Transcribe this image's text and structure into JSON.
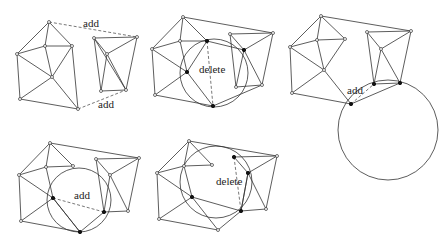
{
  "colors": {
    "stroke": "#333333",
    "background": "#ffffff",
    "text": "#222222"
  },
  "panels": [
    {
      "id": "panel-1",
      "left_mesh": {
        "vertices": [
          [
            49,
            22
          ],
          [
            17,
            54
          ],
          [
            45,
            46
          ],
          [
            72,
            46
          ],
          [
            52,
            77
          ],
          [
            20,
            99
          ],
          [
            78,
            109
          ]
        ],
        "edges": [
          [
            0,
            1
          ],
          [
            0,
            2
          ],
          [
            0,
            3
          ],
          [
            1,
            2
          ],
          [
            2,
            3
          ],
          [
            1,
            4
          ],
          [
            2,
            4
          ],
          [
            3,
            4
          ],
          [
            3,
            6
          ],
          [
            1,
            5
          ],
          [
            4,
            5
          ],
          [
            4,
            6
          ],
          [
            5,
            6
          ]
        ]
      },
      "right_mesh": {
        "vertices": [
          [
            94,
            38
          ],
          [
            137,
            37
          ],
          [
            107,
            54
          ],
          [
            101,
            91
          ],
          [
            126,
            90
          ]
        ],
        "edges": [
          [
            0,
            1
          ],
          [
            0,
            2
          ],
          [
            1,
            2
          ],
          [
            0,
            4
          ],
          [
            1,
            4
          ],
          [
            2,
            3
          ],
          [
            2,
            4
          ],
          [
            3,
            4
          ],
          [
            0,
            3
          ]
        ]
      },
      "dashed": [
        [
          [
            49,
            22
          ],
          [
            137,
            37
          ]
        ],
        [
          [
            78,
            109
          ],
          [
            126,
            90
          ]
        ]
      ],
      "circles": [],
      "solid_vertices": [],
      "labels": [
        {
          "text": "add",
          "x": 83,
          "y": 27
        },
        {
          "text": "add",
          "x": 98,
          "y": 108
        }
      ]
    },
    {
      "id": "panel-2",
      "left_mesh": {
        "vertices": [
          [
            183,
            17
          ],
          [
            152,
            49
          ],
          [
            180,
            41
          ],
          [
            207,
            41
          ],
          [
            187,
            72
          ],
          [
            155,
            95
          ],
          [
            213,
            106
          ]
        ],
        "edges": [
          [
            0,
            1
          ],
          [
            0,
            2
          ],
          [
            0,
            3
          ],
          [
            1,
            2
          ],
          [
            2,
            3
          ],
          [
            1,
            4
          ],
          [
            2,
            4
          ],
          [
            3,
            4
          ],
          [
            1,
            5
          ],
          [
            4,
            5
          ],
          [
            4,
            6
          ],
          [
            5,
            6
          ]
        ]
      },
      "right_mesh": {
        "vertices": [
          [
            230,
            34
          ],
          [
            273,
            33
          ],
          [
            244,
            50
          ],
          [
            236,
            87
          ],
          [
            262,
            85
          ]
        ],
        "edges": [
          [
            0,
            1
          ],
          [
            0,
            2
          ],
          [
            1,
            2
          ],
          [
            0,
            3
          ],
          [
            1,
            4
          ],
          [
            2,
            3
          ],
          [
            2,
            4
          ],
          [
            3,
            4
          ]
        ]
      },
      "extra_edges": [
        [
          [
            183,
            17
          ],
          [
            273,
            33
          ]
        ],
        [
          [
            213,
            106
          ],
          [
            262,
            85
          ]
        ],
        [
          [
            207,
            41
          ],
          [
            244,
            50
          ]
        ]
      ],
      "dashed": [
        [
          [
            207,
            41
          ],
          [
            213,
            106
          ]
        ]
      ],
      "circles": [
        {
          "cx": 214,
          "cy": 73,
          "r": 34
        }
      ],
      "solid_vertices": [
        [
          207,
          41
        ],
        [
          187,
          72
        ],
        [
          213,
          106
        ],
        [
          244,
          50
        ]
      ],
      "labels": [
        {
          "text": "delete",
          "x": 199,
          "y": 73
        }
      ]
    },
    {
      "id": "panel-3",
      "left_mesh": {
        "vertices": [
          [
            321,
            16
          ],
          [
            290,
            47
          ],
          [
            317,
            40
          ],
          [
            345,
            39
          ],
          [
            324,
            70
          ],
          [
            292,
            93
          ],
          [
            351,
            104
          ]
        ],
        "edges": [
          [
            0,
            1
          ],
          [
            0,
            2
          ],
          [
            0,
            3
          ],
          [
            1,
            2
          ],
          [
            2,
            3
          ],
          [
            1,
            4
          ],
          [
            2,
            4
          ],
          [
            3,
            4
          ],
          [
            1,
            5
          ],
          [
            4,
            5
          ],
          [
            4,
            6
          ],
          [
            5,
            6
          ]
        ]
      },
      "right_mesh": {
        "vertices": [
          [
            367,
            32
          ],
          [
            411,
            31
          ],
          [
            381,
            49
          ],
          [
            374,
            84
          ],
          [
            400,
            83
          ]
        ],
        "edges": [
          [
            0,
            1
          ],
          [
            0,
            2
          ],
          [
            1,
            2
          ],
          [
            0,
            3
          ],
          [
            1,
            4
          ],
          [
            2,
            3
          ],
          [
            2,
            4
          ],
          [
            3,
            4
          ]
        ]
      },
      "extra_edges": [
        [
          [
            321,
            16
          ],
          [
            411,
            31
          ]
        ],
        [
          [
            351,
            104
          ],
          [
            400,
            83
          ]
        ]
      ],
      "dashed": [
        [
          [
            351,
            104
          ],
          [
            374,
            84
          ]
        ]
      ],
      "circles": [
        {
          "cx": 388,
          "cy": 130,
          "r": 50
        }
      ],
      "solid_vertices": [
        [
          351,
          104
        ],
        [
          374,
          84
        ],
        [
          400,
          83
        ]
      ],
      "labels": [
        {
          "text": "add",
          "x": 347,
          "y": 94
        }
      ]
    },
    {
      "id": "panel-4",
      "left_mesh": {
        "vertices": [
          [
            50,
            143
          ],
          [
            19,
            175
          ],
          [
            46,
            167
          ],
          [
            73,
            166
          ],
          [
            53,
            198
          ],
          [
            21,
            221
          ],
          [
            80,
            232
          ]
        ],
        "edges": [
          [
            0,
            1
          ],
          [
            0,
            2
          ],
          [
            0,
            3
          ],
          [
            1,
            2
          ],
          [
            2,
            3
          ],
          [
            1,
            4
          ],
          [
            2,
            4
          ],
          [
            1,
            5
          ],
          [
            4,
            5
          ],
          [
            4,
            6
          ],
          [
            5,
            6
          ]
        ]
      },
      "right_mesh": {
        "vertices": [
          [
            96,
            159
          ],
          [
            139,
            158
          ],
          [
            110,
            175
          ],
          [
            104,
            212
          ],
          [
            128,
            211
          ]
        ],
        "edges": [
          [
            0,
            1
          ],
          [
            0,
            2
          ],
          [
            1,
            2
          ],
          [
            0,
            3
          ],
          [
            1,
            4
          ],
          [
            2,
            3
          ],
          [
            2,
            4
          ],
          [
            3,
            4
          ]
        ]
      },
      "extra_edges": [
        [
          [
            50,
            143
          ],
          [
            139,
            158
          ]
        ],
        [
          [
            80,
            232
          ],
          [
            104,
            212
          ]
        ],
        [
          [
            53,
            198
          ],
          [
            80,
            232
          ]
        ]
      ],
      "dashed": [
        [
          [
            53,
            198
          ],
          [
            104,
            212
          ]
        ]
      ],
      "circles": [
        {
          "cx": 79,
          "cy": 200,
          "r": 32
        }
      ],
      "solid_vertices": [
        [
          53,
          198
        ],
        [
          104,
          212
        ],
        [
          80,
          232
        ]
      ],
      "labels": [
        {
          "text": "add",
          "x": 74,
          "y": 199
        }
      ]
    },
    {
      "id": "panel-5",
      "left_mesh": {
        "vertices": [
          [
            189,
            141
          ],
          [
            157,
            173
          ],
          [
            184,
            166
          ],
          [
            212,
            165
          ],
          [
            192,
            197
          ],
          [
            159,
            219
          ],
          [
            218,
            230
          ]
        ],
        "edges": [
          [
            0,
            1
          ],
          [
            0,
            2
          ],
          [
            0,
            3
          ],
          [
            1,
            2
          ],
          [
            2,
            3
          ],
          [
            1,
            4
          ],
          [
            2,
            4
          ],
          [
            1,
            5
          ],
          [
            4,
            5
          ],
          [
            4,
            6
          ],
          [
            5,
            6
          ]
        ]
      },
      "right_mesh": {
        "vertices": [
          [
            234,
            157
          ],
          [
            277,
            156
          ],
          [
            248,
            173
          ],
          [
            241,
            211
          ],
          [
            266,
            209
          ]
        ],
        "edges": [
          [
            0,
            1
          ],
          [
            1,
            2
          ],
          [
            1,
            4
          ],
          [
            2,
            3
          ],
          [
            2,
            4
          ],
          [
            3,
            4
          ]
        ]
      },
      "extra_edges": [
        [
          [
            189,
            141
          ],
          [
            277,
            156
          ]
        ],
        [
          [
            218,
            230
          ],
          [
            241,
            211
          ]
        ],
        [
          [
            192,
            197
          ],
          [
            241,
            211
          ]
        ],
        [
          [
            234,
            157
          ],
          [
            248,
            173
          ]
        ],
        [
          [
            248,
            173
          ],
          [
            241,
            211
          ]
        ]
      ],
      "dashed": [
        [
          [
            234,
            157
          ],
          [
            241,
            211
          ]
        ]
      ],
      "circles": [
        {
          "cx": 216,
          "cy": 182,
          "r": 36
        }
      ],
      "solid_vertices": [
        [
          192,
          197
        ],
        [
          234,
          157
        ],
        [
          248,
          173
        ],
        [
          241,
          211
        ]
      ],
      "labels": [
        {
          "text": "delete",
          "x": 216,
          "y": 185
        }
      ]
    }
  ]
}
